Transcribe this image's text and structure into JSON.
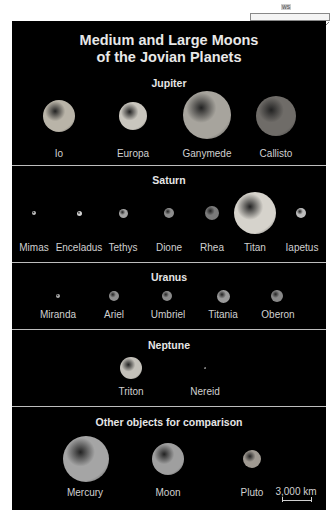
{
  "title": {
    "line1": "Medium and Large Moons",
    "line2": "of the Jovian Planets"
  },
  "header_widget": {
    "label": "WS",
    "icon": "telescope-icon"
  },
  "sections": [
    {
      "name": "Jupiter",
      "moons": [
        {
          "name": "Io",
          "cx": 59,
          "cy": 116,
          "r": 16,
          "color": "#b9b4a8"
        },
        {
          "name": "Europa",
          "cx": 133,
          "cy": 116,
          "r": 14,
          "color": "#c9c6be"
        },
        {
          "name": "Ganymede",
          "cx": 207,
          "cy": 115,
          "r": 24,
          "color": "#a7a49d"
        },
        {
          "name": "Callisto",
          "cx": 276,
          "cy": 116,
          "r": 20,
          "color": "#6f6c68"
        }
      ]
    },
    {
      "name": "Saturn",
      "moons": [
        {
          "name": "Mimas",
          "cx": 34,
          "cy": 213,
          "r": 2,
          "color": "#bdbdbd"
        },
        {
          "name": "Enceladus",
          "cx": 79,
          "cy": 213,
          "r": 2.5,
          "color": "#d0d0d0"
        },
        {
          "name": "Tethys",
          "cx": 123,
          "cy": 213,
          "r": 4.5,
          "color": "#a3a3a3"
        },
        {
          "name": "Dione",
          "cx": 169,
          "cy": 213,
          "r": 5,
          "color": "#8d8d8d"
        },
        {
          "name": "Rhea",
          "cx": 212,
          "cy": 213,
          "r": 7,
          "color": "#7b7b7b"
        },
        {
          "name": "Titan",
          "cx": 255,
          "cy": 213,
          "r": 21,
          "color": "#d6d3cc"
        },
        {
          "name": "Iapetus",
          "cx": 301,
          "cy": 213,
          "r": 5,
          "color": "#bcbcbc"
        }
      ]
    },
    {
      "name": "Uranus",
      "moons": [
        {
          "name": "Miranda",
          "cx": 58,
          "cy": 296,
          "r": 2,
          "color": "#aaaaaa"
        },
        {
          "name": "Ariel",
          "cx": 114,
          "cy": 296,
          "r": 5,
          "color": "#8e8e8e"
        },
        {
          "name": "Umbriel",
          "cx": 167,
          "cy": 296,
          "r": 5,
          "color": "#8a8a8a"
        },
        {
          "name": "Titania",
          "cx": 223,
          "cy": 296,
          "r": 6.5,
          "color": "#9a9a9a"
        },
        {
          "name": "Oberon",
          "cx": 277,
          "cy": 296,
          "r": 6,
          "color": "#888888"
        }
      ]
    },
    {
      "name": "Neptune",
      "moons": [
        {
          "name": "Triton",
          "cx": 131,
          "cy": 368,
          "r": 11,
          "color": "#c4c1ba"
        },
        {
          "name": "Nereid",
          "cx": 205,
          "cy": 368,
          "r": 1,
          "color": "#999999"
        }
      ]
    },
    {
      "name": "Other objects for comparison",
      "moons": [
        {
          "name": "Mercury",
          "cx": 86,
          "cy": 459,
          "r": 23,
          "color": "#a5a5a5"
        },
        {
          "name": "Moon",
          "cx": 168,
          "cy": 459,
          "r": 16,
          "color": "#9f9f9f"
        },
        {
          "name": "Pluto",
          "cx": 252,
          "cy": 459,
          "r": 9,
          "color": "#a09a92"
        }
      ]
    }
  ],
  "scale": {
    "label": "3,000 km"
  }
}
